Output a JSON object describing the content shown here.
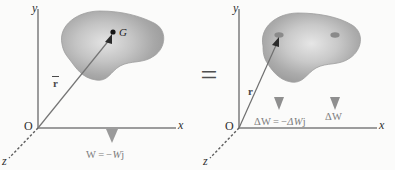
{
  "figure": {
    "equals_sign": "=",
    "background_color": "#fbfbfa",
    "body_fill_color": "#a9a9a9",
    "body_highlight_color": "#dedede",
    "axis_color": "#9a9a9a",
    "arrow_color": "#8f8f8f",
    "text_color": "#3a3a3a"
  },
  "left_panel": {
    "name": "resultant-weight-diagram",
    "axes": {
      "y_label": "y",
      "x_label": "x",
      "z_label": "z",
      "origin_label": "O"
    },
    "body": {
      "name": "rigid-body-blob",
      "center_of_gravity_label": "G"
    },
    "position_vector": {
      "label": "r",
      "has_overbar": true,
      "from": "O",
      "to": "G"
    },
    "force_arrow": {
      "label_parts": {
        "bold_symbol": "W",
        "equals": "=",
        "minus": "−",
        "italic_magnitude": "W",
        "unit_vector": "j"
      },
      "label_plain": "W = −Wj",
      "direction": "down"
    }
  },
  "right_panel": {
    "name": "elemental-weights-diagram",
    "axes": {
      "y_label": "y",
      "x_label": "x",
      "z_label": "z",
      "origin_label": "O"
    },
    "body": {
      "name": "rigid-body-blob",
      "element_points": 2
    },
    "position_vector": {
      "label": "r",
      "has_overbar": false,
      "from": "O",
      "to": "element-point"
    },
    "force_arrows": [
      {
        "label_parts": {
          "bold_symbol": "ΔW",
          "equals": "=",
          "minus": "−",
          "italic_magnitude": "ΔW",
          "unit_vector": "j"
        },
        "label_plain": "ΔW = −ΔWj",
        "direction": "down"
      },
      {
        "label_plain": "ΔW",
        "direction": "down"
      }
    ]
  }
}
